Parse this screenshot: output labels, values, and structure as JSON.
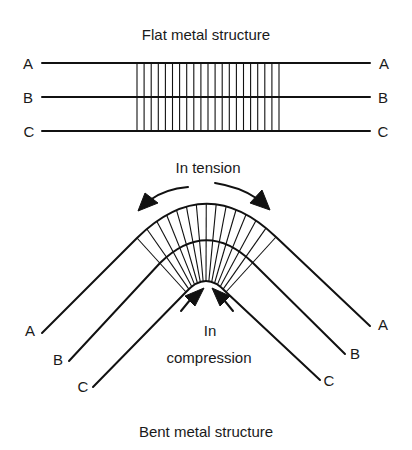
{
  "flat": {
    "title": "Flat metal structure",
    "layers": [
      {
        "id": "A",
        "label_left": "A",
        "label_right": "A",
        "y": 63
      },
      {
        "id": "B",
        "label_left": "B",
        "label_right": "B",
        "y": 97
      },
      {
        "id": "C",
        "label_left": "C",
        "label_right": "C",
        "y": 131
      }
    ],
    "line_x_start": 42,
    "line_x_end": 370,
    "grid_x_start": 137,
    "grid_x_end": 279,
    "grid_line_count": 21
  },
  "bent": {
    "title": "Bent metal structure",
    "tension_label": "In tension",
    "compression_label_line1": "In",
    "compression_label_line2": "compression",
    "layers": [
      {
        "id": "A",
        "label_left": "A",
        "label_right": "A"
      },
      {
        "id": "B",
        "label_left": "B",
        "label_right": "B"
      },
      {
        "id": "C",
        "label_left": "C",
        "label_right": "C"
      }
    ],
    "radial_line_count": 15
  },
  "colors": {
    "ink": "#111111",
    "background": "#ffffff"
  }
}
